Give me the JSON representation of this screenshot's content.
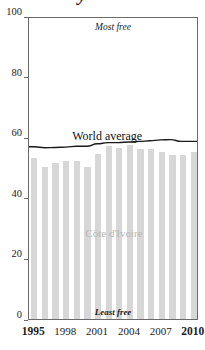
{
  "title_partial": "y",
  "annotations": {
    "most_free": "Most free",
    "least_free": "Least free",
    "world_average_label": "World average",
    "country_label": "Côte d'Ivoire"
  },
  "axis": {
    "y_ticks": [
      "0",
      "20",
      "40",
      "60",
      "80",
      "100"
    ],
    "x_ticks": [
      "1995",
      "1998",
      "2001",
      "2004",
      "2007",
      "2010"
    ],
    "x_ticks_bold": [
      "1995",
      "2010"
    ]
  },
  "colors": {
    "bar": "#d7d7d7",
    "line": "#1a1a1a",
    "frame": "#6a6a6a",
    "country_label": "#b6b6b6",
    "text": "#1b1b1b"
  },
  "chart_data": {
    "type": "bar",
    "title": "",
    "xlabel": "",
    "ylabel": "",
    "ylim": [
      0,
      100
    ],
    "xlim": [
      1995,
      2010
    ],
    "grid": false,
    "legend": "inline-annotations",
    "categories": [
      "1995",
      "1996",
      "1997",
      "1998",
      "1999",
      "2000",
      "2001",
      "2002",
      "2003",
      "2004",
      "2005",
      "2006",
      "2007",
      "2008",
      "2009",
      "2010"
    ],
    "series": [
      {
        "name": "Côte d'Ivoire",
        "type": "bar",
        "values": [
          53.0,
          50.2,
          51.5,
          52.0,
          52.2,
          50.3,
          54.5,
          57.2,
          56.4,
          57.4,
          56.2,
          56.0,
          55.0,
          54.0,
          54.2,
          55.0
        ]
      },
      {
        "name": "World average",
        "type": "line",
        "values": [
          57.2,
          56.9,
          57.0,
          57.1,
          57.4,
          57.4,
          58.2,
          58.6,
          58.6,
          58.8,
          59.0,
          59.2,
          59.5,
          59.6,
          59.0,
          59.0
        ]
      }
    ]
  }
}
